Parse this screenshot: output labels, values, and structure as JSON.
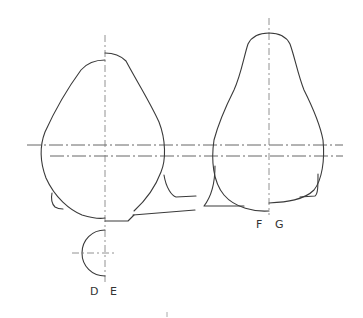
{
  "diagram": {
    "type": "technical-drawing",
    "colors": {
      "line": "#3a3a3a",
      "center_line": "#555555",
      "background": "#ffffff"
    },
    "labels": {
      "d": "D",
      "e": "E",
      "f": "F",
      "g": "G"
    },
    "shapes": [
      {
        "name": "left-profile",
        "axis_x": 105,
        "split_labels": [
          "D",
          "E"
        ]
      },
      {
        "name": "right-profile",
        "axis_x": 269,
        "split_labels": [
          "F",
          "G"
        ]
      }
    ],
    "center_lines": [
      {
        "orientation": "horizontal",
        "y": 145
      },
      {
        "orientation": "horizontal",
        "y": 156
      }
    ],
    "footer_mark": "|"
  }
}
